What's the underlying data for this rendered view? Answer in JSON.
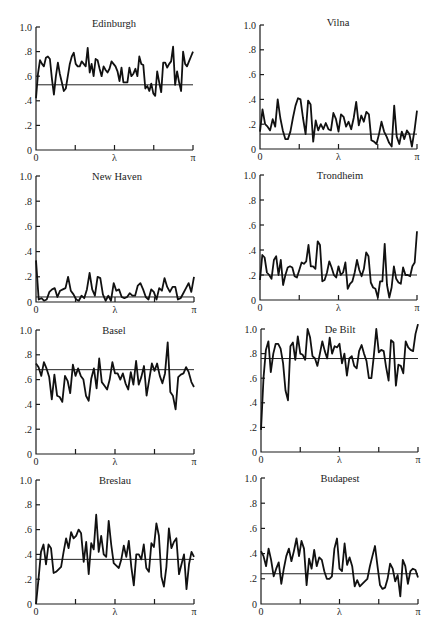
{
  "chart_data": [
    {
      "type": "line",
      "title": "Edinburgh",
      "xlabel": "λ",
      "xticks": [
        "0",
        "λ",
        "π"
      ],
      "yticks": [
        "0",
        ".2",
        ".4",
        ".6",
        ".8",
        "1.0"
      ],
      "ylim": [
        0,
        1.0
      ],
      "xlim": [
        0,
        3.1416
      ],
      "reference_line": 0.53,
      "values": [
        0.42,
        0.62,
        0.73,
        0.7,
        0.68,
        0.75,
        0.76,
        0.74,
        0.58,
        0.45,
        0.6,
        0.71,
        0.62,
        0.55,
        0.48,
        0.5,
        0.6,
        0.7,
        0.76,
        0.79,
        0.7,
        0.68,
        0.68,
        0.72,
        0.7,
        0.68,
        0.83,
        0.63,
        0.7,
        0.6,
        0.74,
        0.73,
        0.66,
        0.6,
        0.68,
        0.65,
        0.63,
        0.66,
        0.72,
        0.7,
        0.68,
        0.64,
        0.56,
        0.67,
        0.55,
        0.55,
        0.55,
        0.67,
        0.6,
        0.62,
        0.66,
        0.6,
        0.76,
        0.7,
        0.69,
        0.5,
        0.52,
        0.48,
        0.54,
        0.46,
        0.44,
        0.64,
        0.55,
        0.47,
        0.71,
        0.71,
        0.67,
        0.7,
        0.72,
        0.84,
        0.53,
        0.64,
        0.55,
        0.48,
        0.8,
        0.7,
        0.68,
        0.72,
        0.76,
        0.8
      ]
    },
    {
      "type": "line",
      "title": "Vilna",
      "xlabel": "λ",
      "xticks": [
        "0",
        "λ",
        "π"
      ],
      "yticks": [
        "0",
        ".2",
        ".4",
        ".6",
        ".8",
        "1.0"
      ],
      "ylim": [
        0,
        1.0
      ],
      "xlim": [
        0,
        3.1416
      ],
      "reference_line": 0.12,
      "values": [
        0.14,
        0.32,
        0.2,
        0.18,
        0.15,
        0.24,
        0.18,
        0.4,
        0.25,
        0.15,
        0.08,
        0.08,
        0.14,
        0.25,
        0.35,
        0.41,
        0.4,
        0.25,
        0.12,
        0.39,
        0.36,
        0.06,
        0.23,
        0.15,
        0.2,
        0.16,
        0.21,
        0.16,
        0.15,
        0.29,
        0.24,
        0.14,
        0.28,
        0.26,
        0.18,
        0.22,
        0.16,
        0.25,
        0.38,
        0.19,
        0.27,
        0.22,
        0.3,
        0.28,
        0.07,
        0.06,
        0.04,
        0.12,
        0.22,
        0.14,
        0.1,
        0.05,
        0.02,
        0.35,
        0.1,
        0.04,
        0.14,
        0.08,
        0.15,
        0.12,
        0.02,
        0.15,
        0.31
      ]
    },
    {
      "type": "line",
      "title": "New Haven",
      "xlabel": "λ",
      "xticks": [
        "0",
        "λ",
        "π"
      ],
      "yticks": [
        "0",
        ".2",
        ".4",
        ".6",
        ".8",
        "1.0"
      ],
      "ylim": [
        0,
        1.0
      ],
      "xlim": [
        0,
        3.1416
      ],
      "reference_line": 0.04,
      "values": [
        0.33,
        0.02,
        0.03,
        0.01,
        0.02,
        0.08,
        0.1,
        0.11,
        0.04,
        0.09,
        0.1,
        0.11,
        0.2,
        0.09,
        0.06,
        0.02,
        0.01,
        0.05,
        0.03,
        0.1,
        0.23,
        0.1,
        0.05,
        0.2,
        0.19,
        0.06,
        0.01,
        0.05,
        0.01,
        0.15,
        0.09,
        0.1,
        0.04,
        0.03,
        0.04,
        0.07,
        0.05,
        0.05,
        0.13,
        0.15,
        0.1,
        0.04,
        0.02,
        0.1,
        0.08,
        0.02,
        0.11,
        0.09,
        0.19,
        0.12,
        0.08,
        0.12,
        0.12,
        0.02,
        0.03,
        0.07,
        0.11,
        0.15,
        0.08,
        0.2
      ]
    },
    {
      "type": "line",
      "title": "Trondheim",
      "xlabel": "λ",
      "xticks": [
        "0",
        "λ",
        "π"
      ],
      "yticks": [
        "0",
        ".2",
        ".4",
        ".6",
        ".8",
        "1.0"
      ],
      "ylim": [
        0,
        1.0
      ],
      "xlim": [
        0,
        3.1416
      ],
      "reference_line": 0.2,
      "values": [
        0.16,
        0.36,
        0.34,
        0.22,
        0.2,
        0.17,
        0.32,
        0.35,
        0.2,
        0.32,
        0.12,
        0.2,
        0.26,
        0.27,
        0.26,
        0.19,
        0.18,
        0.24,
        0.3,
        0.29,
        0.31,
        0.44,
        0.27,
        0.27,
        0.25,
        0.47,
        0.44,
        0.15,
        0.16,
        0.22,
        0.31,
        0.26,
        0.2,
        0.18,
        0.27,
        0.2,
        0.22,
        0.3,
        0.09,
        0.13,
        0.15,
        0.22,
        0.32,
        0.24,
        0.19,
        0.25,
        0.38,
        0.35,
        0.14,
        0.1,
        0.09,
        0.02,
        0.15,
        0.15,
        0.45,
        0.12,
        0.02,
        0.1,
        0.27,
        0.17,
        0.14,
        0.13,
        0.26,
        0.2,
        0.2,
        0.19,
        0.27,
        0.3,
        0.55
      ]
    },
    {
      "type": "line",
      "title": "Basel",
      "xlabel": "λ",
      "xticks": [
        "0",
        "λ",
        "π"
      ],
      "yticks": [
        "0",
        ".2",
        ".4",
        ".6",
        ".8",
        "1.0"
      ],
      "ylim": [
        0,
        1.0
      ],
      "xlim": [
        0,
        3.1416
      ],
      "reference_line": 0.68,
      "values": [
        0.73,
        0.7,
        0.63,
        0.74,
        0.69,
        0.62,
        0.44,
        0.64,
        0.47,
        0.46,
        0.42,
        0.63,
        0.59,
        0.49,
        0.72,
        0.63,
        0.69,
        0.63,
        0.6,
        0.47,
        0.43,
        0.61,
        0.69,
        0.53,
        0.77,
        0.58,
        0.55,
        0.52,
        0.6,
        0.74,
        0.65,
        0.65,
        0.6,
        0.65,
        0.57,
        0.52,
        0.66,
        0.56,
        0.75,
        0.56,
        0.62,
        0.71,
        0.47,
        0.6,
        0.73,
        0.67,
        0.73,
        0.63,
        0.57,
        0.65,
        0.9,
        0.5,
        0.47,
        0.36,
        0.62,
        0.64,
        0.65,
        0.7,
        0.66,
        0.58,
        0.54
      ]
    },
    {
      "type": "line",
      "title": "De Bilt",
      "xlabel": "λ",
      "xticks": [
        "0",
        "λ",
        "π"
      ],
      "yticks": [
        "0",
        ".2",
        ".4",
        ".6",
        ".8",
        "1.0"
      ],
      "ylim": [
        0,
        1.0
      ],
      "xlim": [
        0,
        3.1416
      ],
      "reference_line": 0.76,
      "values": [
        0.18,
        0.6,
        0.83,
        0.9,
        0.65,
        0.8,
        0.88,
        0.88,
        0.84,
        0.72,
        0.5,
        0.42,
        0.86,
        0.89,
        0.75,
        0.94,
        0.8,
        0.79,
        0.75,
        1.0,
        0.93,
        0.78,
        0.76,
        0.7,
        0.8,
        0.9,
        0.82,
        0.76,
        0.93,
        0.8,
        0.86,
        0.85,
        0.88,
        0.72,
        0.8,
        0.62,
        0.76,
        0.78,
        0.7,
        0.68,
        0.82,
        0.87,
        0.8,
        0.74,
        0.6,
        0.6,
        0.78,
        1.0,
        0.81,
        0.83,
        0.82,
        0.69,
        0.58,
        0.91,
        0.89,
        0.54,
        0.71,
        0.7,
        0.64,
        0.9,
        0.85,
        0.83,
        0.82,
        0.96,
        1.04
      ]
    },
    {
      "type": "line",
      "title": "Breslau",
      "xlabel": "λ",
      "xticks": [
        "0",
        "λ",
        "π"
      ],
      "yticks": [
        "0",
        ".2",
        ".4",
        ".6",
        ".8",
        "1.0"
      ],
      "ylim": [
        0,
        1.0
      ],
      "xlim": [
        0,
        3.1416
      ],
      "reference_line": 0.36,
      "values": [
        0.0,
        0.2,
        0.42,
        0.48,
        0.32,
        0.48,
        0.45,
        0.25,
        0.26,
        0.28,
        0.3,
        0.42,
        0.53,
        0.45,
        0.58,
        0.53,
        0.55,
        0.6,
        0.57,
        0.34,
        0.5,
        0.24,
        0.49,
        0.44,
        0.72,
        0.42,
        0.55,
        0.4,
        0.38,
        0.67,
        0.48,
        0.33,
        0.31,
        0.29,
        0.36,
        0.47,
        0.38,
        0.51,
        0.3,
        0.15,
        0.4,
        0.4,
        0.36,
        0.48,
        0.29,
        0.26,
        0.49,
        0.46,
        0.65,
        0.55,
        0.22,
        0.14,
        0.3,
        0.61,
        0.45,
        0.5,
        0.53,
        0.24,
        0.32,
        0.4,
        0.12,
        0.32,
        0.42,
        0.38
      ]
    },
    {
      "type": "line",
      "title": "Budapest",
      "xlabel": "λ",
      "xticks": [
        "0",
        "λ",
        "π"
      ],
      "yticks": [
        "0",
        ".2",
        ".4",
        ".6",
        ".8",
        "1.0"
      ],
      "ylim": [
        0,
        1.0
      ],
      "xlim": [
        0,
        3.1416
      ],
      "reference_line": 0.24,
      "values": [
        0.42,
        0.38,
        0.3,
        0.44,
        0.35,
        0.22,
        0.28,
        0.33,
        0.16,
        0.28,
        0.38,
        0.44,
        0.34,
        0.42,
        0.52,
        0.38,
        0.5,
        0.44,
        0.15,
        0.36,
        0.28,
        0.43,
        0.3,
        0.37,
        0.35,
        0.26,
        0.2,
        0.2,
        0.22,
        0.44,
        0.52,
        0.28,
        0.26,
        0.48,
        0.31,
        0.37,
        0.3,
        0.14,
        0.19,
        0.14,
        0.16,
        0.18,
        0.2,
        0.3,
        0.38,
        0.46,
        0.3,
        0.15,
        0.12,
        0.13,
        0.2,
        0.32,
        0.28,
        0.18,
        0.23,
        0.06,
        0.35,
        0.3,
        0.16,
        0.26,
        0.28,
        0.27,
        0.21
      ]
    }
  ],
  "panels": [
    {
      "title": "Edinburgh"
    },
    {
      "title": "Vilna"
    },
    {
      "title": "New Haven"
    },
    {
      "title": "Trondheim"
    },
    {
      "title": "Basel"
    },
    {
      "title": "De Bilt"
    },
    {
      "title": "Breslau"
    },
    {
      "title": "Budapest"
    }
  ],
  "axis_labels": {
    "x0": "0",
    "xmid": "λ",
    "xend": "π"
  },
  "y_tick_labels": [
    "0",
    ".2",
    ".4",
    ".6",
    ".8",
    "1.0"
  ]
}
